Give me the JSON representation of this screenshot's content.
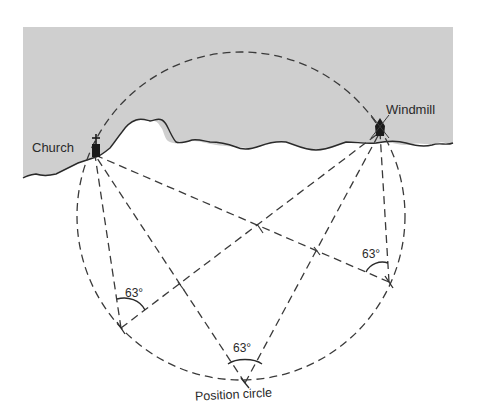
{
  "diagram": {
    "land_color": "#cfcfcf",
    "line_color": "#3a3a3a",
    "landmarks": [
      {
        "name": "Church",
        "x": 95,
        "y": 155
      },
      {
        "name": "Windmill",
        "x": 380,
        "y": 132
      }
    ],
    "positions": [
      {
        "id": "left",
        "x": 121,
        "y": 328,
        "angle_label": "63°",
        "label_x": 124,
        "label_y": 300
      },
      {
        "id": "bottom",
        "x": 245,
        "y": 383,
        "angle_label": "63°",
        "label_x": 233,
        "label_y": 348
      },
      {
        "id": "right",
        "x": 389,
        "y": 282,
        "angle_label": "63°",
        "label_x": 362,
        "label_y": 256
      }
    ],
    "circle": {
      "cx": 241,
      "cy": 216,
      "r": 164
    },
    "caption": "Position circle"
  }
}
